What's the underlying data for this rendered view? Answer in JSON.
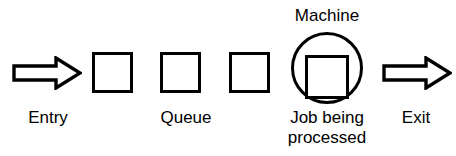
{
  "diagram": {
    "type": "queueing-system-flow",
    "background_color": "#ffffff",
    "stroke_color": "#000000",
    "text_color": "#000000",
    "labels": {
      "entry": "Entry",
      "queue": "Queue",
      "machine": "Machine",
      "job_being_processed_line1": "Job being",
      "job_being_processed_line2": "processed",
      "exit": "Exit"
    },
    "shapes": {
      "entry_arrow": "block-arrow-right",
      "exit_arrow": "block-arrow-right",
      "queue_job_1": "square",
      "queue_job_2": "square",
      "queue_job_3": "square",
      "machine": "circle",
      "job_in_machine": "square"
    },
    "counts": {
      "queued_jobs": 3,
      "jobs_in_machine": 1
    }
  }
}
